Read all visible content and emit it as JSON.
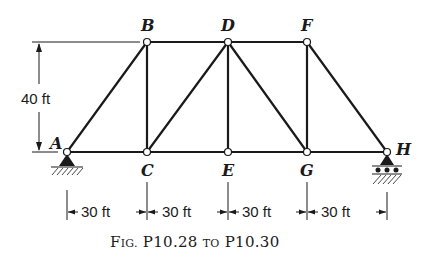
{
  "figure": {
    "caption": "Fig. P10.28 to P10.30",
    "caption_parts": {
      "fig": "F",
      "ig": "IG.",
      "num1": "P10.28",
      "to": "TO",
      "num2": "P10.30"
    }
  },
  "truss": {
    "nodes": {
      "A": {
        "label": "A"
      },
      "B": {
        "label": "B"
      },
      "C": {
        "label": "C"
      },
      "D": {
        "label": "D"
      },
      "E": {
        "label": "E"
      },
      "F": {
        "label": "F"
      },
      "G": {
        "label": "G"
      },
      "H": {
        "label": "H"
      }
    },
    "members": [
      "AB",
      "AC",
      "BC",
      "BD",
      "CD",
      "CE",
      "DE",
      "DG",
      "DF",
      "EG",
      "FG",
      "FH",
      "GH"
    ],
    "supports": {
      "A": "pin",
      "H": "roller"
    }
  },
  "dimensions": {
    "height": "40 ft",
    "spans": [
      "30 ft",
      "30 ft",
      "30 ft",
      "30 ft"
    ]
  }
}
